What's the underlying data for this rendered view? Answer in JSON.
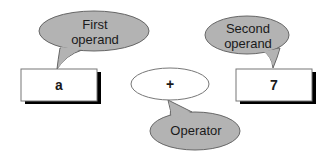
{
  "diagram": {
    "first_operand": {
      "callout_line1": "First",
      "callout_line2": "operand",
      "value": "a"
    },
    "operator": {
      "symbol": "+",
      "callout": "Operator"
    },
    "second_operand": {
      "callout_line1": "Second",
      "callout_line2": "operand",
      "value": "7"
    },
    "colors": {
      "callout_fill": "#b3b3b3",
      "stroke": "#555555",
      "box_fill": "#ffffff",
      "shadow": "#000000"
    }
  }
}
